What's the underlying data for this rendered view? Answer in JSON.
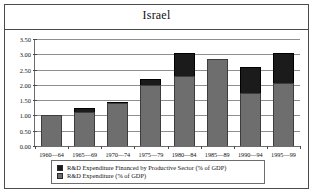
{
  "chart_data": {
    "type": "bar",
    "stacked": true,
    "title": "Israel",
    "xlabel": "",
    "ylabel": "",
    "ylim": [
      0.0,
      3.5
    ],
    "ytick_labels": [
      "3.50",
      "3.00",
      "2.50",
      "2.00",
      "1.50",
      "1.00",
      "0.50",
      "0.00"
    ],
    "ytick_values": [
      3.5,
      3.0,
      2.5,
      2.0,
      1.5,
      1.0,
      0.5,
      0.0
    ],
    "grid": true,
    "legend_position": "bottom",
    "categories": [
      "1960—64",
      "1965—69",
      "1970—74",
      "1975—79",
      "1980—84",
      "1985—89",
      "1990—94",
      "1995—99"
    ],
    "series": [
      {
        "name": "R&D Expenditure (% of GDP)",
        "color": "#6e6e6e",
        "values": [
          1.0,
          1.1,
          1.4,
          2.0,
          2.3,
          2.85,
          1.75,
          2.05
        ]
      },
      {
        "name": "R&D Expenditure Financed by Productive Sector (% of GDP)",
        "color": "#1b1b1b",
        "values": [
          0.0,
          0.15,
          0.05,
          0.2,
          0.75,
          0.0,
          0.85,
          1.0
        ]
      }
    ],
    "totals": [
      1.0,
      1.25,
      1.45,
      2.2,
      3.05,
      2.85,
      2.6,
      3.05
    ]
  },
  "legend": {
    "entries": [
      {
        "label": "R&D Expenditure Financed by Productive Sector (% of GDP)",
        "color": "#1b1b1b"
      },
      {
        "label": "R&D Expenditure (% of GDP)",
        "color": "#6e6e6e"
      }
    ]
  }
}
